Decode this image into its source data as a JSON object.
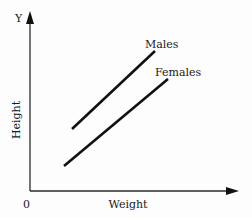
{
  "chart_data": {
    "type": "line",
    "title": "",
    "xlabel": "Weight",
    "ylabel": "Height",
    "y_axis_letter": "Y",
    "origin_label": "0",
    "grid": false,
    "legend": "inline labels at line ends",
    "x_ticks": [],
    "y_ticks": [],
    "series": [
      {
        "name": "Males",
        "points_px": [
          [
            72,
            129
          ],
          [
            155,
            51
          ]
        ],
        "label_pos": [
          145,
          48
        ]
      },
      {
        "name": "Females",
        "points_px": [
          [
            64,
            166
          ],
          [
            168,
            79
          ]
        ],
        "label_pos": [
          155,
          76
        ]
      }
    ],
    "colors": {
      "axis": "#2a2a2a",
      "line": "#111111",
      "background": "#fdfdfd"
    }
  }
}
